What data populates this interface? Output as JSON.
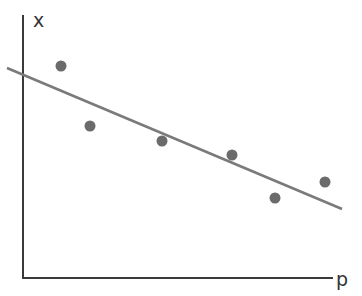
{
  "chart_data": {
    "type": "scatter",
    "title": "",
    "xlabel": "p",
    "ylabel": "x",
    "grid": false,
    "legend": null,
    "axis_ticks": "none",
    "points": [
      {
        "x": 61,
        "y": 66
      },
      {
        "x": 90,
        "y": 126
      },
      {
        "x": 162,
        "y": 141
      },
      {
        "x": 232,
        "y": 155
      },
      {
        "x": 275,
        "y": 198
      },
      {
        "x": 325,
        "y": 182
      }
    ],
    "trend_line": {
      "x1": 7,
      "y1": 68,
      "x2": 342,
      "y2": 209,
      "slope": "negative"
    },
    "annotations": [],
    "colors": {
      "points": "#6b6b6b",
      "trend_line": "#7a7a7a",
      "axes": "#3a3a3a"
    }
  },
  "labels": {
    "x_axis": "p",
    "y_axis": "x"
  }
}
